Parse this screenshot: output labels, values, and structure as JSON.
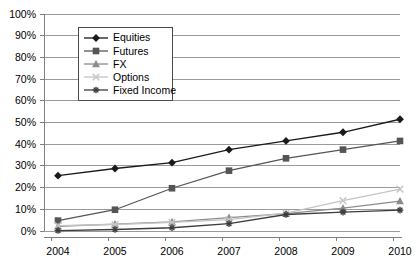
{
  "chart_data": {
    "type": "line",
    "title": "",
    "subtitle": "",
    "xlabel": "",
    "ylabel": "",
    "categories": [
      "2004",
      "2005",
      "2006",
      "2007",
      "2008",
      "2009",
      "2010"
    ],
    "x": [
      2004,
      2005,
      2006,
      2007,
      2008,
      2009,
      2010
    ],
    "ylim": [
      0,
      100
    ],
    "ytick_values": [
      0,
      10,
      20,
      30,
      40,
      50,
      60,
      70,
      80,
      90,
      100
    ],
    "ytick_labels": [
      "0%",
      "10%",
      "20%",
      "30%",
      "40%",
      "50%",
      "60%",
      "70%",
      "80%",
      "90%",
      "100%"
    ],
    "grid": "horizontal",
    "legend_position": "top-left-inside",
    "series": [
      {
        "name": "Equities",
        "marker": "diamond",
        "color": "#1a1a1a",
        "values": [
          25.5,
          28.8,
          31.5,
          37.5,
          41.5,
          45.5,
          51.5
        ]
      },
      {
        "name": "Futures",
        "marker": "square",
        "color": "#555555",
        "values": [
          4.8,
          9.8,
          19.7,
          27.8,
          33.5,
          37.5,
          41.5
        ]
      },
      {
        "name": "FX",
        "marker": "triangle",
        "color": "#8c8c8c",
        "values": [
          2.2,
          3.2,
          4.2,
          6.2,
          8.0,
          10.5,
          13.8
        ]
      },
      {
        "name": "Options",
        "marker": "x",
        "color": "#c4c4c4",
        "values": [
          2.5,
          3.0,
          4.0,
          5.2,
          8.2,
          14.0,
          19.3
        ]
      },
      {
        "name": "Fixed Income",
        "marker": "asterisk",
        "color": "#3d3d3d",
        "values": [
          0.2,
          0.7,
          1.5,
          3.4,
          7.6,
          8.7,
          9.6
        ]
      }
    ]
  },
  "legend": {
    "entries": [
      {
        "label": "Equities"
      },
      {
        "label": "Futures"
      },
      {
        "label": "FX"
      },
      {
        "label": "Options"
      },
      {
        "label": "Fixed Income"
      }
    ]
  },
  "colors": {
    "axis": "#7f7f7f",
    "gridline": "#9a9a9a",
    "legend_border": "#4a4a4a",
    "background": "#ffffff",
    "text": "#000000"
  }
}
